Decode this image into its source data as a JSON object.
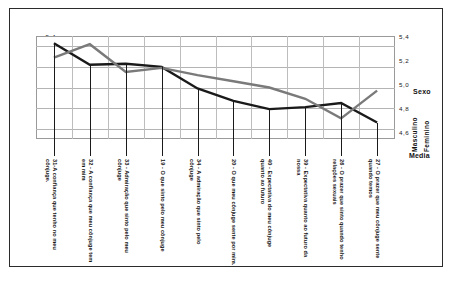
{
  "chart_data": {
    "type": "line",
    "title": "",
    "subtitle": "",
    "xlabel": "",
    "ylabel": "Media",
    "ylim": [
      4.5,
      5.5
    ],
    "yticks": [
      "5,4",
      "5,2",
      "5,0",
      "4,8",
      "4,6"
    ],
    "ytick_values": [
      5.4,
      5.2,
      5.0,
      4.8,
      4.6
    ],
    "grid": true,
    "legend_position": "right",
    "legend_title": "Sexo",
    "categories": [
      "31-A confiança que tenho no meu cônjuge.",
      "32 - A confiança que meu cônjuge tem em mim",
      "33 - Admiração que sinto pelo meu cônjuge",
      "19 - O que sinto pelo meu cônjuge",
      "34 - A admiração que sinto pelo cônjuge",
      "20 - O que meu cônjuge sente por mim.",
      "40 - Expectativa do meu cônjuge quanto ao futuro",
      "39 - Expectativa quanto ao futuro da nossa",
      "26 - O prazer que sinto quando tenho relações sexuais",
      "27 - O prazer que meu cônjuge sente quando temos"
    ],
    "series": [
      {
        "name": "Masculino",
        "color": "#1a1a1a",
        "values": [
          5.43,
          5.22,
          5.23,
          5.2,
          4.99,
          4.87,
          4.79,
          4.81,
          4.85,
          4.66
        ]
      },
      {
        "name": "Feminino",
        "color": "#7a7a7a",
        "values": [
          5.29,
          5.42,
          5.15,
          5.19,
          5.12,
          5.06,
          5.0,
          4.89,
          4.7,
          4.97
        ]
      }
    ]
  },
  "legend": {
    "title": "Sexo",
    "items": [
      {
        "label": "Masculino",
        "color": "#1a1a1a"
      },
      {
        "label": "Feminino",
        "color": "#7a7a7a"
      }
    ],
    "axis_caption": "Media"
  },
  "axes": {
    "y_left_ticks": [
      "5,4",
      "5,2",
      "5,0",
      "4,8",
      "4,6"
    ],
    "y_right_ticks": [
      "5,4",
      "5,2",
      "5,0",
      "4,8",
      "4,6"
    ]
  }
}
